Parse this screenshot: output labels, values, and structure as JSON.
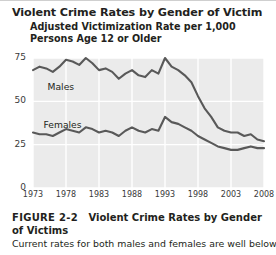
{
  "chart_title": "Violent Crime Rates by Gender of Victim",
  "chart_subtitle": "Adjusted Victimization Rate per 1,000 Persons Age 12 or Older",
  "series_labels": {
    "males": "Males",
    "females": "Females"
  },
  "caption": {
    "figure_number": "FIGURE 2-2",
    "figure_title": "Violent Crime Rates by Gender of Victims",
    "body": "Current rates for both males and females are well below"
  },
  "colors": {
    "line": "#595959",
    "plot_background": "#ebebeb",
    "gridline": "#ffffff",
    "text": "#231f20"
  },
  "chart_data": {
    "type": "line",
    "title": "Violent Crime Rates by Gender of Victim",
    "subtitle": "Adjusted Victimization Rate per 1,000 Persons Age 12 or Older",
    "xlabel": "",
    "ylabel": "Adjusted Victimization Rate per 1,000 Persons Age 12 or Older",
    "xlim": [
      1973,
      2008
    ],
    "ylim": [
      0,
      75
    ],
    "yticks": [
      0,
      25,
      50,
      75
    ],
    "xticks": [
      1973,
      1978,
      1983,
      1988,
      1993,
      1998,
      2003,
      2008
    ],
    "grid": true,
    "legend": "inline-labels",
    "x": [
      1973,
      1974,
      1975,
      1976,
      1977,
      1978,
      1979,
      1980,
      1981,
      1982,
      1983,
      1984,
      1985,
      1986,
      1987,
      1988,
      1989,
      1990,
      1991,
      1992,
      1993,
      1994,
      1995,
      1996,
      1997,
      1998,
      1999,
      2000,
      2001,
      2002,
      2003,
      2004,
      2005,
      2006,
      2007,
      2008
    ],
    "series": [
      {
        "name": "Males",
        "values": [
          68,
          70,
          69,
          67,
          70,
          74,
          73,
          71,
          75,
          72,
          68,
          69,
          67,
          63,
          66,
          68,
          65,
          64,
          68,
          66,
          75,
          70,
          68,
          65,
          61,
          53,
          46,
          41,
          35,
          33,
          32,
          32,
          30,
          31,
          28,
          27
        ]
      },
      {
        "name": "Females",
        "values": [
          32,
          31,
          31,
          30,
          32,
          34,
          33,
          32,
          35,
          34,
          32,
          33,
          32,
          30,
          33,
          35,
          33,
          32,
          34,
          33,
          41,
          38,
          37,
          35,
          33,
          30,
          28,
          26,
          24,
          23,
          22,
          22,
          23,
          24,
          23,
          23
        ]
      }
    ]
  }
}
